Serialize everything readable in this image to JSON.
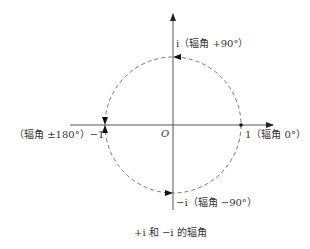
{
  "diagram": {
    "caption": "+i 和 −i 的辐角",
    "origin_label": "O",
    "points": {
      "pos_i": "i（辐角 +90°）",
      "neg_i": "−i（辐角 −90°）",
      "one": "1（辐角 0°）",
      "neg_one": "（辐角 ±180°）−1"
    },
    "colors": {
      "axis": "#555555",
      "circle": "#777777",
      "text": "#333333"
    }
  }
}
